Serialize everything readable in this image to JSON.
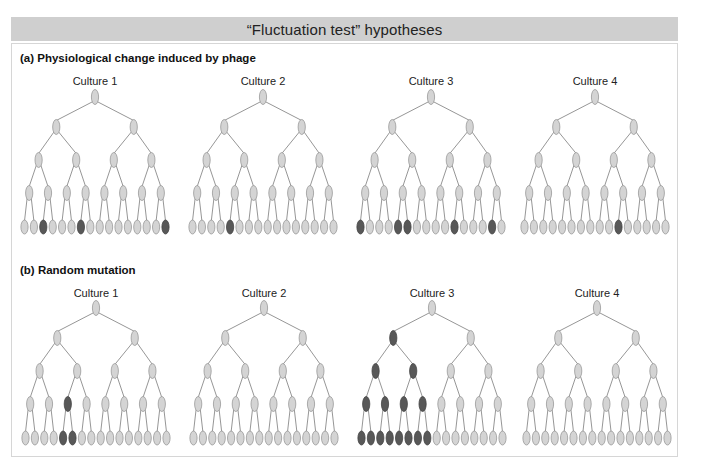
{
  "title": "“Fluctuation test” hypotheses",
  "colors": {
    "header_bg": "#cfcfcf",
    "cell_normal_fill": "#d4d4d4",
    "cell_normal_stroke": "#999999",
    "cell_resistant_fill": "#585858",
    "cell_resistant_stroke": "#444444",
    "line": "#8a8a8a"
  },
  "sections": [
    {
      "id": "a",
      "label": "(a)  Physiological change induced by phage",
      "cultures": [
        {
          "label": "Culture 1",
          "dark": {
            "4": [
              2,
              6,
              15
            ]
          }
        },
        {
          "label": "Culture 2",
          "dark": {
            "4": [
              4
            ]
          }
        },
        {
          "label": "Culture 3",
          "dark": {
            "4": [
              0,
              4,
              5,
              10,
              14
            ]
          }
        },
        {
          "label": "Culture 4",
          "dark": {
            "4": [
              10
            ]
          }
        }
      ]
    },
    {
      "id": "b",
      "label": "(b)  Random mutation",
      "cultures": [
        {
          "label": "Culture 1",
          "dark": {
            "3": [
              2
            ],
            "4": [
              4,
              5
            ]
          }
        },
        {
          "label": "Culture 2",
          "dark": {}
        },
        {
          "label": "Culture 3",
          "dark": {
            "1": [
              0
            ],
            "2": [
              0,
              1
            ],
            "3": [
              0,
              1,
              2,
              3
            ],
            "4": [
              0,
              1,
              2,
              3,
              4,
              5,
              6,
              7
            ]
          }
        },
        {
          "label": "Culture 4",
          "dark": {}
        }
      ]
    }
  ]
}
